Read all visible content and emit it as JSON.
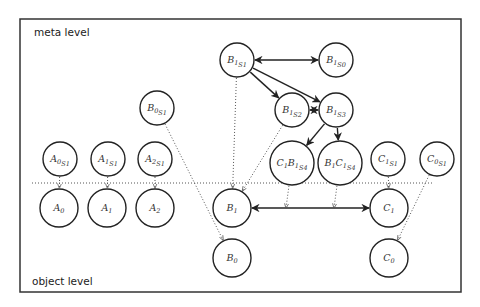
{
  "frame": {
    "x": 20,
    "y": 19,
    "width": 441,
    "height": 273
  },
  "levels": {
    "meta": "meta level",
    "object": "object level"
  },
  "separator": {
    "y": 183,
    "x1": 32,
    "x2": 432
  },
  "nodes": [
    {
      "id": "B1S1",
      "base": "B",
      "sub": "1",
      "subsub": "S1",
      "cx": 237,
      "cy": 60,
      "r": 17
    },
    {
      "id": "B1S0",
      "base": "B",
      "sub": "1",
      "subsub": "S0",
      "cx": 336,
      "cy": 60,
      "r": 17
    },
    {
      "id": "B1S2",
      "base": "B",
      "sub": "1",
      "subsub": "S2",
      "cx": 292,
      "cy": 110,
      "r": 17
    },
    {
      "id": "B1S3",
      "base": "B",
      "sub": "1",
      "subsub": "S3",
      "cx": 336,
      "cy": 110,
      "r": 17
    },
    {
      "id": "C1B1S4",
      "pre": "C",
      "presub": "1",
      "base": "B",
      "sub": "1",
      "subsub": "S4",
      "cx": 292,
      "cy": 163,
      "r": 22
    },
    {
      "id": "B1C1S4",
      "pre": "B",
      "presub": "1",
      "base": "C",
      "sub": "1",
      "subsub": "S4",
      "cx": 340,
      "cy": 163,
      "r": 22
    },
    {
      "id": "B0S1",
      "base": "B",
      "sub": "0",
      "subsub": "S1",
      "cx": 157,
      "cy": 108,
      "r": 17
    },
    {
      "id": "A0S1",
      "base": "A",
      "sub": "0",
      "subsub": "S1",
      "cx": 60,
      "cy": 159,
      "r": 17
    },
    {
      "id": "A1S1",
      "base": "A",
      "sub": "1",
      "subsub": "S1",
      "cx": 108,
      "cy": 159,
      "r": 17
    },
    {
      "id": "A2S1",
      "base": "A",
      "sub": "2",
      "subsub": "S1",
      "cx": 155,
      "cy": 159,
      "r": 17
    },
    {
      "id": "C1S1",
      "base": "C",
      "sub": "1",
      "subsub": "S1",
      "cx": 388,
      "cy": 159,
      "r": 17
    },
    {
      "id": "C0S1",
      "base": "C",
      "sub": "0",
      "subsub": "S1",
      "cx": 437,
      "cy": 159,
      "r": 17
    },
    {
      "id": "A0",
      "base": "A",
      "sub": "0",
      "cx": 59,
      "cy": 208,
      "r": 19
    },
    {
      "id": "A1",
      "base": "A",
      "sub": "1",
      "cx": 107,
      "cy": 208,
      "r": 19
    },
    {
      "id": "A2",
      "base": "A",
      "sub": "2",
      "cx": 155,
      "cy": 208,
      "r": 19
    },
    {
      "id": "B1",
      "base": "B",
      "sub": "1",
      "cx": 232,
      "cy": 208,
      "r": 19
    },
    {
      "id": "C1",
      "base": "C",
      "sub": "1",
      "cx": 389,
      "cy": 208,
      "r": 19
    },
    {
      "id": "B0",
      "base": "B",
      "sub": "0",
      "cx": 232,
      "cy": 258,
      "r": 19
    },
    {
      "id": "C0",
      "base": "C",
      "sub": "0",
      "cx": 389,
      "cy": 258,
      "r": 19
    }
  ],
  "edges": [
    {
      "from": "B1S1",
      "to": "B1S0",
      "style": "solid",
      "bidirectional": true
    },
    {
      "from": "B1S1",
      "to": "B1S2",
      "style": "solid",
      "bidirectional": false
    },
    {
      "from": "B1S1",
      "to": "B1S3",
      "style": "solid",
      "bidirectional": false
    },
    {
      "from": "B1S2",
      "to": "B1S3",
      "style": "solid",
      "bidirectional": true
    },
    {
      "from": "B1S3",
      "to": "C1B1S4",
      "style": "solid",
      "bidirectional": false
    },
    {
      "from": "B1S3",
      "to": "B1C1S4",
      "style": "solid",
      "bidirectional": false
    },
    {
      "from": "B1",
      "to": "C1",
      "style": "solid",
      "bidirectional": true
    },
    {
      "from": "A0S1",
      "to": "A0",
      "style": "dotted"
    },
    {
      "from": "A1S1",
      "to": "A1",
      "style": "dotted"
    },
    {
      "from": "A2S1",
      "to": "A2",
      "style": "dotted"
    },
    {
      "from": "B0S1",
      "to": "B0",
      "style": "dotted"
    },
    {
      "from": "B1S1",
      "to": "B1",
      "style": "dotted"
    },
    {
      "from": "B1S2",
      "to": "B1",
      "style": "dotted"
    },
    {
      "from": "C1S1",
      "to": "C1",
      "style": "dotted"
    },
    {
      "from": "C0S1",
      "to": "C0",
      "style": "dotted"
    },
    {
      "from": "C1B1S4",
      "to": "B1C1edge_a",
      "style": "dotted"
    },
    {
      "from": "B1C1S4",
      "to": "B1C1edge_b",
      "style": "dotted"
    }
  ]
}
